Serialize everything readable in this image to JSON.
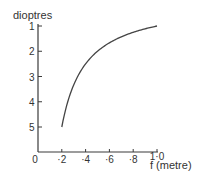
{
  "chart_data": {
    "type": "line",
    "title": "",
    "xlabel": "f (metre)",
    "ylabel": "dioptres",
    "xlim": [
      0,
      1.0
    ],
    "ylim": [
      1,
      6
    ],
    "y_inverted": true,
    "grid": false,
    "legend": null,
    "x_ticks": [
      {
        "value": 0,
        "label": "0"
      },
      {
        "value": 0.2,
        "label": "·2"
      },
      {
        "value": 0.4,
        "label": "·4"
      },
      {
        "value": 0.6,
        "label": "·6"
      },
      {
        "value": 0.8,
        "label": "·8"
      },
      {
        "value": 1.0,
        "label": "1·0"
      }
    ],
    "y_ticks": [
      {
        "value": 1,
        "label": "1"
      },
      {
        "value": 2,
        "label": "2"
      },
      {
        "value": 3,
        "label": "3"
      },
      {
        "value": 4,
        "label": "4"
      },
      {
        "value": 5,
        "label": "5"
      }
    ],
    "series": [
      {
        "name": "power = 1/f",
        "x": [
          0.2,
          0.25,
          0.3,
          0.35,
          0.4,
          0.5,
          0.6,
          0.7,
          0.8,
          0.9,
          1.0
        ],
        "values": [
          5.0,
          4.0,
          3.33,
          2.86,
          2.5,
          2.0,
          1.67,
          1.43,
          1.25,
          1.11,
          1.0
        ]
      }
    ]
  },
  "labels": {
    "y_axis_title": "dioptres",
    "x_axis_title": "f (metre)"
  },
  "colors": {
    "axis": "#3a3a3a",
    "curve": "#444444",
    "text": "#333333",
    "background": "#ffffff"
  }
}
